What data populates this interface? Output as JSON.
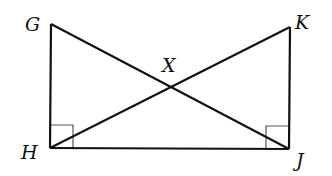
{
  "figure": {
    "colors": {
      "stroke": "#111111",
      "right_angle_mark": "#555555",
      "background": "#ffffff"
    },
    "points": {
      "G": {
        "label": "G",
        "x": 51,
        "y": 24
      },
      "K": {
        "label": "K",
        "x": 290,
        "y": 27
      },
      "H": {
        "label": "H",
        "x": 50,
        "y": 148
      },
      "J": {
        "label": "J",
        "x": 289,
        "y": 149
      },
      "X": {
        "label": "X",
        "x": 170,
        "y": 87
      }
    },
    "segments": [
      "GH",
      "HJ",
      "KJ",
      "GJ",
      "KH"
    ],
    "right_angles": [
      "GHJ",
      "KJH"
    ]
  }
}
